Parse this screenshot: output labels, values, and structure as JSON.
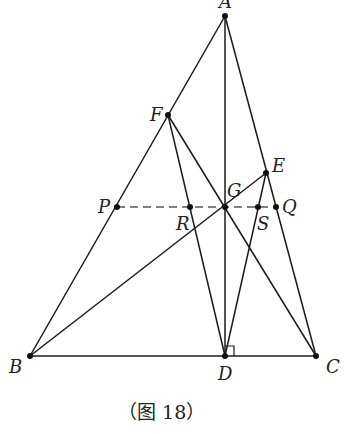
{
  "caption": "（图 18）",
  "points": {
    "A": {
      "label": "A",
      "x": 225,
      "y": 16
    },
    "F": {
      "label": "F",
      "x": 168,
      "y": 115
    },
    "E": {
      "label": "E",
      "x": 266,
      "y": 173
    },
    "G": {
      "label": "G",
      "x": 225,
      "y": 207
    },
    "P": {
      "label": "P",
      "x": 117,
      "y": 207
    },
    "R": {
      "label": "R",
      "x": 190,
      "y": 207
    },
    "S": {
      "label": "S",
      "x": 258,
      "y": 207
    },
    "Q": {
      "label": "Q",
      "x": 276,
      "y": 207
    },
    "B": {
      "label": "B",
      "x": 30,
      "y": 356
    },
    "D": {
      "label": "D",
      "x": 225,
      "y": 356
    },
    "C": {
      "label": "C",
      "x": 316,
      "y": 356
    }
  },
  "segments": [
    [
      "A",
      "B"
    ],
    [
      "A",
      "C"
    ],
    [
      "A",
      "D"
    ],
    [
      "B",
      "C"
    ],
    [
      "F",
      "D"
    ],
    [
      "F",
      "C"
    ],
    [
      "E",
      "D"
    ],
    [
      "E",
      "B"
    ]
  ],
  "dashed_segments": [
    [
      "P",
      "Q"
    ]
  ],
  "right_angle_at": "D",
  "colors": {
    "stroke": "#1a1a1a",
    "dash": "#555555"
  }
}
